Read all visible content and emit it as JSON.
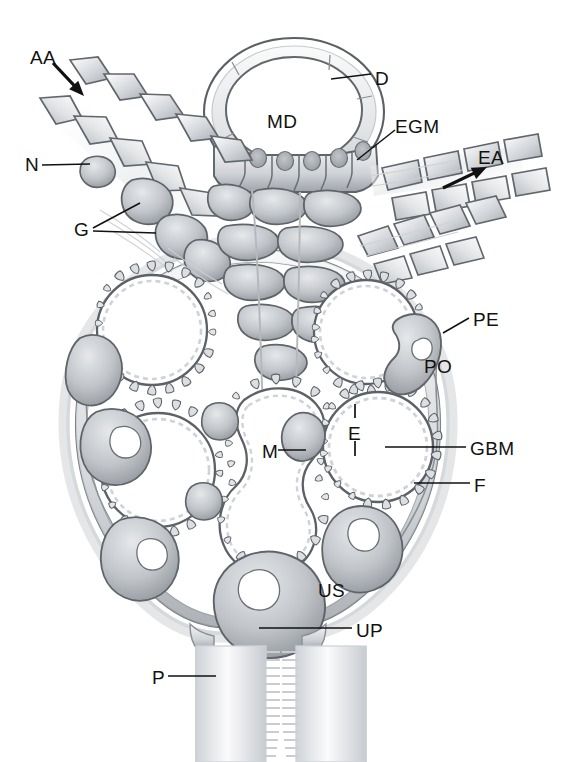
{
  "figure": {
    "kind": "anatomical-diagram",
    "style": "grayscale pen-and-wash line drawing",
    "background_color": "#ffffff",
    "ink_color": "#4a4f55",
    "fill_light": "#f2f3f4",
    "fill_mid": "#c9ccd0",
    "fill_dark": "#9a9ea4"
  },
  "labels": [
    {
      "id": "AA",
      "text": "AA",
      "x": 30,
      "y": 48,
      "meaning": "afferent arteriole",
      "leader": "arrow",
      "arrow_dir": "down-right"
    },
    {
      "id": "D",
      "text": "D",
      "x": 375,
      "y": 69,
      "meaning": "distal tubule",
      "leader": "line"
    },
    {
      "id": "MD",
      "text": "MD",
      "x": 267,
      "y": 112,
      "meaning": "macula densa",
      "leader": "none"
    },
    {
      "id": "EGM",
      "text": "EGM",
      "x": 395,
      "y": 117,
      "meaning": "extraglomerular mesangium",
      "leader": "line"
    },
    {
      "id": "N",
      "text": "N",
      "x": 25,
      "y": 155,
      "meaning": "nerve terminal",
      "leader": "line"
    },
    {
      "id": "EA",
      "text": "EA",
      "x": 478,
      "y": 148,
      "meaning": "efferent arteriole",
      "leader": "arrow",
      "arrow_dir": "up-right"
    },
    {
      "id": "G",
      "text": "G",
      "x": 74,
      "y": 220,
      "meaning": "granular (juxtaglomerular) cells",
      "leader": "double-line"
    },
    {
      "id": "PE",
      "text": "PE",
      "x": 473,
      "y": 310,
      "meaning": "parietal epithelium",
      "leader": "line"
    },
    {
      "id": "PO",
      "text": "PO",
      "x": 424,
      "y": 357,
      "meaning": "podocyte",
      "leader": "none"
    },
    {
      "id": "E",
      "text": "E",
      "x": 348,
      "y": 424,
      "meaning": "endothelium",
      "leader": "tick-bracket"
    },
    {
      "id": "GBM",
      "text": "GBM",
      "x": 470,
      "y": 439,
      "meaning": "glomerular basement membrane",
      "leader": "line"
    },
    {
      "id": "M",
      "text": "M",
      "x": 262,
      "y": 442,
      "meaning": "mesangium",
      "leader": "line"
    },
    {
      "id": "F",
      "text": "F",
      "x": 474,
      "y": 476,
      "meaning": "foot process",
      "leader": "line"
    },
    {
      "id": "US",
      "text": "US",
      "x": 318,
      "y": 581,
      "meaning": "urinary space",
      "leader": "none"
    },
    {
      "id": "UP",
      "text": "UP",
      "x": 356,
      "y": 621,
      "meaning": "urinary pole",
      "leader": "line"
    },
    {
      "id": "P",
      "text": "P",
      "x": 152,
      "y": 668,
      "meaning": "proximal tubule",
      "leader": "line"
    }
  ],
  "leaders": [
    {
      "for": "AA",
      "type": "arrow",
      "x1": 53,
      "y1": 63,
      "x2": 84,
      "y2": 96
    },
    {
      "for": "EA",
      "type": "arrow",
      "x1": 443,
      "y1": 188,
      "x2": 487,
      "y2": 167
    },
    {
      "for": "D",
      "type": "line",
      "x1": 371,
      "y1": 74,
      "x2": 331,
      "y2": 79
    },
    {
      "for": "EGM",
      "type": "line",
      "x1": 395,
      "y1": 130,
      "x2": 357,
      "y2": 160
    },
    {
      "for": "N",
      "type": "line",
      "x1": 42,
      "y1": 165,
      "x2": 90,
      "y2": 164
    },
    {
      "for": "G1",
      "type": "line",
      "x1": 93,
      "y1": 228,
      "x2": 140,
      "y2": 203
    },
    {
      "for": "G2",
      "type": "line",
      "x1": 93,
      "y1": 231,
      "x2": 156,
      "y2": 233
    },
    {
      "for": "PE",
      "type": "line",
      "x1": 469,
      "y1": 318,
      "x2": 443,
      "y2": 333
    },
    {
      "for": "GBM",
      "type": "line",
      "x1": 466,
      "y1": 447,
      "x2": 385,
      "y2": 447
    },
    {
      "for": "F",
      "type": "line",
      "x1": 470,
      "y1": 483,
      "x2": 414,
      "y2": 483
    },
    {
      "for": "M",
      "type": "line",
      "x1": 278,
      "y1": 450,
      "x2": 306,
      "y2": 450
    },
    {
      "for": "UP",
      "type": "line",
      "x1": 352,
      "y1": 628,
      "x2": 259,
      "y2": 628
    },
    {
      "for": "P",
      "type": "line",
      "x1": 168,
      "y1": 676,
      "x2": 216,
      "y2": 676
    },
    {
      "for": "Eup",
      "type": "tick",
      "x1": 355,
      "y1": 404,
      "x2": 355,
      "y2": 418
    },
    {
      "for": "Edn",
      "type": "tick",
      "x1": 355,
      "y1": 441,
      "x2": 355,
      "y2": 456
    }
  ],
  "structures": {
    "distal_tubule": {
      "center": [
        294,
        113
      ],
      "rx": 88,
      "ry": 72,
      "lumen_rx": 70,
      "lumen_ry": 55
    },
    "macula_densa_cells": 6,
    "capillary_loops": 5,
    "proximal_tubule_limbs": 2,
    "bowman_capsule": {
      "center": [
        258,
        430
      ],
      "rx": 190,
      "ry": 185
    }
  }
}
